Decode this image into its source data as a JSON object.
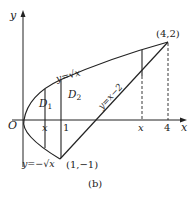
{
  "diagram": {
    "caption": "(b)",
    "axes": {
      "x_label": "x",
      "y_label": "y",
      "origin_label": "O",
      "x_ticks": [
        "x",
        "1",
        "x",
        "4"
      ]
    },
    "curves": {
      "upper": "y=√x",
      "lower": "y=−√x",
      "line": "y=x−2"
    },
    "points": {
      "p1": "(1,−1)",
      "p2": "(4,2)"
    },
    "regions": {
      "d1": "D",
      "d1_sub": "1",
      "d2": "D",
      "d2_sub": "2"
    },
    "colors": {
      "stroke": "#222222",
      "background": "#ffffff"
    }
  }
}
